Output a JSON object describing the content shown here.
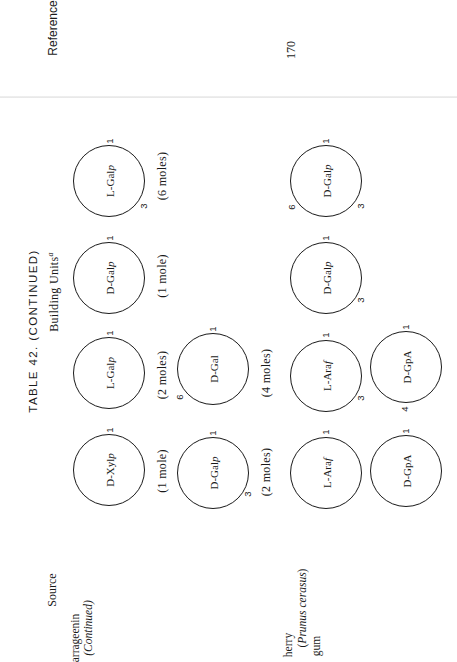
{
  "page": {
    "header_left": "Reference",
    "page_number": "170",
    "table_title": "TABLE 42. (CONTINUED)",
    "column_heading": "Building Units",
    "column_heading_superscript": "a",
    "source_heading": "Source"
  },
  "sources": [
    {
      "line1": "arrageenin",
      "line2": "(Continued)",
      "line3": ""
    },
    {
      "line1": "herry",
      "line2": "(Prunus cerasus)",
      "line3": "gum"
    }
  ],
  "units": [
    {
      "id": "u1",
      "label": "L-Galp",
      "positions": {
        "top": "1",
        "bottom_right": "3"
      },
      "moles": "(6 moles)"
    },
    {
      "id": "u2",
      "label": "D-Galp",
      "positions": {
        "top": "1"
      },
      "moles": "(1 mole)"
    },
    {
      "id": "u3",
      "label": "L-Galp",
      "positions": {
        "top": "1"
      },
      "moles": "(2 moles)"
    },
    {
      "id": "u4",
      "label": "D-Xylp",
      "positions": {
        "top": "1"
      },
      "moles": "(1 mole)"
    },
    {
      "id": "u5",
      "label": "D-Gal",
      "positions": {
        "top": "1",
        "bottom_left": "6"
      },
      "moles": "(4 moles)"
    },
    {
      "id": "u6",
      "label": "D-Galp",
      "positions": {
        "top": "1",
        "bottom_right": "3"
      },
      "moles": "(2 moles)"
    },
    {
      "id": "u7",
      "label": "D-Galp",
      "positions": {
        "top": "1",
        "bottom_left": "6",
        "bottom_right": "3"
      }
    },
    {
      "id": "u8",
      "label": "D-Galp",
      "positions": {
        "top": "1",
        "bottom_right": "3"
      }
    },
    {
      "id": "u9",
      "label": "L-Araf",
      "positions": {
        "top": "1",
        "bottom_right": "3"
      }
    },
    {
      "id": "u10",
      "label": "L-Araf",
      "positions": {
        "top": "1"
      }
    },
    {
      "id": "u11",
      "label": "D-GpA",
      "positions": {
        "top": "1",
        "bottom_left": "4"
      }
    },
    {
      "id": "u12",
      "label": "D-GpA",
      "positions": {
        "top": "1"
      }
    }
  ]
}
